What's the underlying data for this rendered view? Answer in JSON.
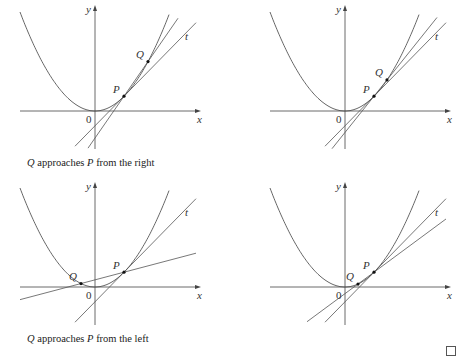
{
  "figure": {
    "k": 0.0176,
    "colors": {
      "curve": "#555555",
      "axis": "#444444",
      "point": "#111111"
    },
    "panels": [
      {
        "id": "top-left",
        "origin": [
          95,
          111
        ],
        "x_range": [
          -75,
          74
        ],
        "y_axis_top": 5,
        "y_axis_bottom": 149,
        "x_axis_left": 20,
        "x_axis_right": 201,
        "P": 29,
        "Q": 53,
        "line_x_range": [
          -22,
          101
        ],
        "t_x_range": [
          -20,
          101
        ],
        "secant_x_range": [
          -7,
          83
        ],
        "labels": {
          "y": "y",
          "x": "x",
          "origin": "0",
          "P": "P",
          "Q": "Q",
          "t": "t"
        },
        "caption": {
          "q": "Q",
          "mid": " approaches ",
          "p": "P",
          "tail": " from the right"
        }
      },
      {
        "id": "top-right",
        "origin": [
          345,
          111
        ],
        "x_range": [
          -75,
          74
        ],
        "y_axis_top": 5,
        "y_axis_bottom": 149,
        "x_axis_left": 270,
        "x_axis_right": 451,
        "P": 29,
        "Q": 42,
        "t_x_range": [
          -20,
          101
        ],
        "secant_x_range": [
          -13,
          92
        ],
        "labels": {
          "y": "y",
          "x": "x",
          "origin": "0",
          "P": "P",
          "Q": "Q",
          "t": "t"
        },
        "caption": null
      },
      {
        "id": "bottom-left",
        "origin": [
          95,
          287
        ],
        "x_range": [
          -75,
          74
        ],
        "y_axis_top": 182,
        "y_axis_bottom": 325,
        "x_axis_left": 20,
        "x_axis_right": 201,
        "P": 29,
        "Q": -14,
        "t_x_range": [
          -20,
          101
        ],
        "secant_x_range": [
          -75,
          101
        ],
        "labels": {
          "y": "y",
          "x": "x",
          "origin": "0",
          "P": "P",
          "Q": "Q",
          "t": "t"
        },
        "caption": {
          "q": "Q",
          "mid": " approaches ",
          "p": "P",
          "tail": " from the left"
        }
      },
      {
        "id": "bottom-right",
        "origin": [
          345,
          287
        ],
        "x_range": [
          -75,
          74
        ],
        "y_axis_top": 182,
        "y_axis_bottom": 325,
        "x_axis_left": 270,
        "x_axis_right": 451,
        "P": 29,
        "Q": 13,
        "t_x_range": [
          -20,
          101
        ],
        "secant_x_range": [
          -38,
          101
        ],
        "labels": {
          "y": "y",
          "x": "x",
          "origin": "0",
          "P": "P",
          "Q": "Q",
          "t": "t"
        },
        "caption": null
      }
    ]
  },
  "captions": {
    "right": {
      "q": "Q",
      "rest1": " approaches ",
      "p": "P",
      "rest2": " from the right"
    },
    "left": {
      "q": "Q",
      "rest1": " approaches ",
      "p": "P",
      "rest2": " from the left"
    }
  },
  "checkbox": {
    "checked": false
  }
}
